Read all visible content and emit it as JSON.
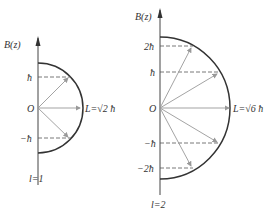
{
  "diagrams": [
    {
      "id": "l1",
      "axis_label": "B(z)",
      "origin_label": "O",
      "magnitude_label": "L=√2 ħ",
      "quantum_label": "l=1",
      "ticks": [
        {
          "label": "ħ",
          "m": 1
        },
        {
          "label": "−ħ",
          "m": -1
        }
      ],
      "m_values": [
        1,
        0,
        -1
      ]
    },
    {
      "id": "l2",
      "axis_label": "B(z)",
      "origin_label": "O",
      "magnitude_label": "L=√6 ħ",
      "quantum_label": "l=2",
      "ticks": [
        {
          "label": "2ħ",
          "m": 2
        },
        {
          "label": "ħ",
          "m": 1
        },
        {
          "label": "−ħ",
          "m": -1
        },
        {
          "label": "−2ħ",
          "m": -2
        }
      ],
      "m_values": [
        2,
        1,
        0,
        -1,
        -2
      ]
    }
  ],
  "colors": {
    "axis": "#444444",
    "arc": "#333333",
    "vector": "#999999",
    "dashed": "#555555"
  }
}
